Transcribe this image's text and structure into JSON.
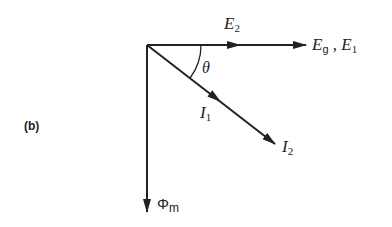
{
  "figure": {
    "panel_label": "(b)",
    "type": "phasor diagram",
    "colors": {
      "stroke": "#222222",
      "background": "#ffffff"
    },
    "vectors": [
      {
        "id": "E2",
        "label_main": "E",
        "label_sub": "2",
        "direction": "horizontal-right",
        "length": "short"
      },
      {
        "id": "Eg_E1",
        "label_main": "E",
        "label_sub": "g",
        "label_sep": " , ",
        "label_main2": "E",
        "label_sub2": "1",
        "direction": "horizontal-right",
        "length": "long"
      },
      {
        "id": "I1",
        "label_main": "I",
        "label_sub": "1",
        "direction": "lagging by theta",
        "length": "short"
      },
      {
        "id": "I2",
        "label_main": "I",
        "label_sub": "2",
        "direction": "lagging by theta",
        "length": "long"
      },
      {
        "id": "Phi_m",
        "label_main": "Φ",
        "label_sub": "m",
        "direction": "vertical-down",
        "length": "long"
      }
    ],
    "angle": {
      "symbol": "θ",
      "between": [
        "E",
        "I"
      ]
    }
  }
}
